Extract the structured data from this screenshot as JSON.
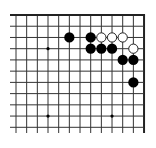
{
  "diagram": {
    "type": "go-board-partial",
    "view": "top-right corner",
    "colors": {
      "background": "#ffffff",
      "line": "#333333",
      "border": "#222222",
      "black_stone": "#000000",
      "white_stone_fill": "#ffffff",
      "white_stone_stroke": "#222222",
      "star_point": "#000000"
    },
    "grid": {
      "columns": 13,
      "rows": 11,
      "origin_x": 16,
      "origin_y": 15,
      "spacing_x": 10.67,
      "spacing_y": 11.23,
      "left_extend_to": 10,
      "bottom_extend_to": 133,
      "edges": [
        "top",
        "right"
      ]
    },
    "star_points": [
      {
        "col": 3,
        "row": 3
      },
      {
        "col": 3,
        "row": 9
      },
      {
        "col": 9,
        "row": 9
      }
    ],
    "stones": [
      {
        "color": "black",
        "col": 5,
        "row": 2
      },
      {
        "color": "black",
        "col": 7,
        "row": 2
      },
      {
        "color": "white",
        "col": 8,
        "row": 2
      },
      {
        "color": "white",
        "col": 9,
        "row": 2
      },
      {
        "color": "white",
        "col": 10,
        "row": 2
      },
      {
        "color": "black",
        "col": 7,
        "row": 3
      },
      {
        "color": "black",
        "col": 8,
        "row": 3
      },
      {
        "color": "black",
        "col": 9,
        "row": 3
      },
      {
        "color": "white",
        "col": 11,
        "row": 3
      },
      {
        "color": "black",
        "col": 10,
        "row": 4
      },
      {
        "color": "black",
        "col": 11,
        "row": 4
      },
      {
        "color": "black",
        "col": 11,
        "row": 6
      }
    ]
  }
}
